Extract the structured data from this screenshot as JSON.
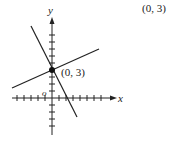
{
  "header": {
    "answer": "(0, 3)"
  },
  "graph": {
    "x_axis_label": "x",
    "y_axis_label": "y",
    "origin_label": "o",
    "point_label": "(0, 3)",
    "point": [
      0,
      3
    ],
    "tick_spacing_px": 7,
    "colors": {
      "axis": "#222222",
      "line": "#222222",
      "point": "#111111"
    }
  }
}
